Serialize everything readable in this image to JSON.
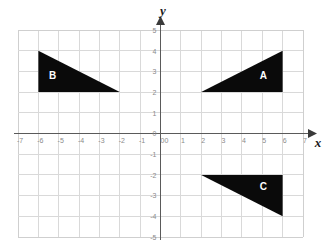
{
  "chart_data": {
    "type": "scatter",
    "title": "",
    "xlabel": "x",
    "ylabel": "y",
    "xlim": [
      -7,
      7
    ],
    "ylim": [
      -5,
      5
    ],
    "grid": true,
    "legend": "none",
    "x_ticks": [
      "-7",
      "-6",
      "-5",
      "-4",
      "-3",
      "-2",
      "-1",
      "0",
      "1",
      "2",
      "3",
      "4",
      "5",
      "6",
      "7"
    ],
    "y_ticks": [
      "5",
      "4",
      "3",
      "2",
      "1",
      "0",
      "-1",
      "-2",
      "-3",
      "-4",
      "-5"
    ],
    "origin_label": "0",
    "shapes": [
      {
        "label": "A",
        "kind": "right-triangle",
        "fill": "#0a0a0a",
        "label_color": "#ffffff",
        "label_point": [
          5.05,
          2.75
        ],
        "vertices": [
          [
            2,
            2
          ],
          [
            6,
            2
          ],
          [
            6,
            4
          ]
        ]
      },
      {
        "label": "B",
        "kind": "right-triangle",
        "fill": "#0a0a0a",
        "label_color": "#ffffff",
        "label_point": [
          -5.3,
          2.75
        ],
        "vertices": [
          [
            -6,
            4
          ],
          [
            -6,
            2
          ],
          [
            -2,
            2
          ]
        ]
      },
      {
        "label": "C",
        "kind": "right-triangle",
        "fill": "#0a0a0a",
        "label_color": "#ffffff",
        "label_point": [
          5.05,
          -2.6
        ],
        "vertices": [
          [
            2,
            -2
          ],
          [
            6,
            -2
          ],
          [
            6,
            -4
          ]
        ]
      }
    ]
  },
  "axes": {
    "x_axis_name": "x",
    "y_axis_name": "y"
  }
}
